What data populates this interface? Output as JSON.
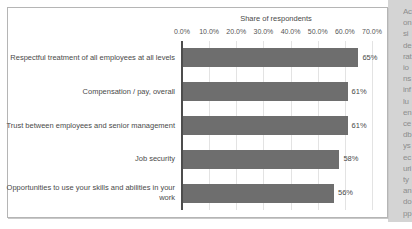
{
  "chart_data": {
    "type": "bar",
    "orientation": "horizontal",
    "title": "Share of respondents",
    "xlabel": "",
    "ylabel": "",
    "xlim": [
      0,
      70
    ],
    "grid": true,
    "legend": false,
    "bar_color": "#6e6e6e",
    "axis_color": "#4d4d4d",
    "gridline_color": "#e3e3e3",
    "xticks": [
      "0.0%",
      "10.0%",
      "20.0%",
      "30.0%",
      "40.0%",
      "50.0%",
      "60.0%",
      "70.0%"
    ],
    "xtick_values": [
      0,
      10,
      20,
      30,
      40,
      50,
      60,
      70
    ],
    "categories": [
      "Respectful treatment of all employees at all levels",
      "Compensation / pay, overall",
      "Trust between employees and senior management",
      "Job security",
      "Opportunities to use your skills and abilities in your work"
    ],
    "values": [
      65,
      61,
      61,
      58,
      56
    ],
    "value_labels": [
      "65%",
      "61%",
      "61%",
      "58%",
      "56%"
    ]
  },
  "page": {
    "gutter_text": "Aconsiderationsinfluencedbysecurityandopportunities"
  }
}
